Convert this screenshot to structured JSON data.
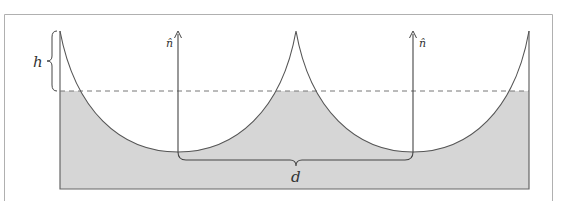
{
  "diagram": {
    "labels": {
      "height": "h",
      "normal_left": "n̂",
      "normal_right": "n̂",
      "period": "d"
    },
    "colors": {
      "frame": "#b0b0b0",
      "curve": "#555555",
      "fill": "#d6d6d6",
      "dashed_level": "#777777",
      "text": "#333333"
    },
    "geometry": {
      "container_left_x": 60,
      "container_right_x": 529,
      "container_bottom_y": 189,
      "cusp_top_y": 31,
      "water_level_y": 91,
      "trough_y": 152,
      "cusp_xs": [
        60,
        296,
        529
      ],
      "trough_xs": [
        178,
        413
      ]
    }
  }
}
